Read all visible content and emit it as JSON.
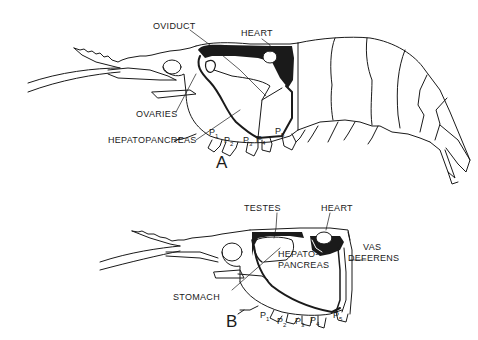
{
  "figure": {
    "panel_a": {
      "letter": "A",
      "sex": "female",
      "labels": {
        "oviduct": "OVIDUCT",
        "heart": "HEART",
        "ovaries": "OVARIES",
        "hepatopancreas": "HEPATOPANCREAS"
      },
      "legs": [
        {
          "p": "P",
          "n": "1"
        },
        {
          "p": "P",
          "n": "2"
        },
        {
          "p": "P",
          "n": "3"
        },
        {
          "p": "P",
          "n": "4"
        },
        {
          "p": "P",
          "n": "5"
        }
      ]
    },
    "panel_b": {
      "letter": "B",
      "sex": "male",
      "labels": {
        "testes": "TESTES",
        "heart": "HEART",
        "hepatopancreas_1": "HEPATO-",
        "hepatopancreas_2": "PANCREAS",
        "vas_deferens_1": "VAS",
        "vas_deferens_2": "DEFERENS",
        "stomach": "STOMACH"
      },
      "legs": [
        {
          "p": "P",
          "n": "1"
        },
        {
          "p": "P",
          "n": "2"
        },
        {
          "p": "P",
          "n": "3"
        },
        {
          "p": "P",
          "n": "4"
        },
        {
          "p": "P",
          "n": "5"
        }
      ]
    },
    "colors": {
      "ink": "#1a1a1a",
      "background": "#ffffff"
    }
  }
}
